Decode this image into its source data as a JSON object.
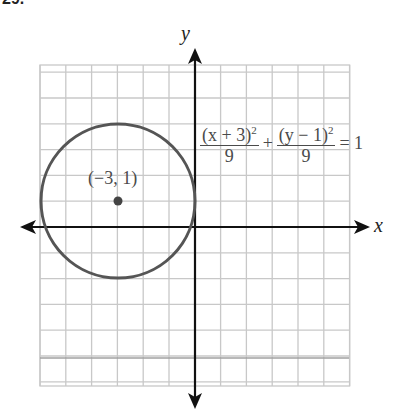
{
  "problem": {
    "number_label": "29."
  },
  "axes": {
    "x_label": "x",
    "y_label": "y"
  },
  "grid": {
    "x_min": -6,
    "x_max": 6,
    "y_min": -6,
    "y_max": 6,
    "cell_px": 25.8
  },
  "circle": {
    "center": [
      -3,
      1
    ],
    "radius": 3,
    "color": "#555555"
  },
  "center_point": {
    "label": "(−3, 1)"
  },
  "equation": {
    "term1_num": "(x + 3)",
    "term1_exp": "2",
    "term1_den": "9",
    "plus": "+",
    "term2_num": "(y − 1)",
    "term2_exp": "2",
    "term2_den": "9",
    "rhs": "= 1"
  },
  "colors": {
    "grid": "#c8c8c8",
    "axis": "#111111",
    "curve": "#555555",
    "text": "#4a4a4a"
  }
}
